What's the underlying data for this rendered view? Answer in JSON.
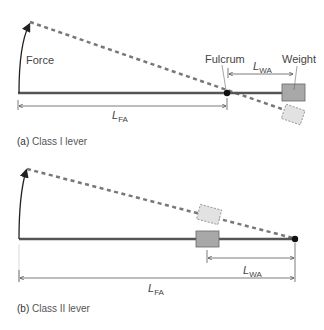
{
  "colors": {
    "lever": "#555555",
    "dashed": "#777777",
    "weight_fill": "#a8a8a8",
    "weight_stroke": "#666666",
    "ghost_fill": "#e2e2e2",
    "ghost_stroke": "#888888",
    "text": "#444444"
  },
  "panel_a": {
    "force_label": "Force",
    "fulcrum_label": "Fulcrum",
    "weight_label": "Weight",
    "lwa": {
      "main": "L",
      "sub": "WA"
    },
    "lfa": {
      "main": "L",
      "sub": "FA"
    },
    "caption_letter": "(a)",
    "caption_text": " Class I lever"
  },
  "panel_b": {
    "lwa": {
      "main": "L",
      "sub": "WA"
    },
    "lfa": {
      "main": "L",
      "sub": "FA"
    },
    "caption_letter": "(b)",
    "caption_text": " Class II lever"
  }
}
